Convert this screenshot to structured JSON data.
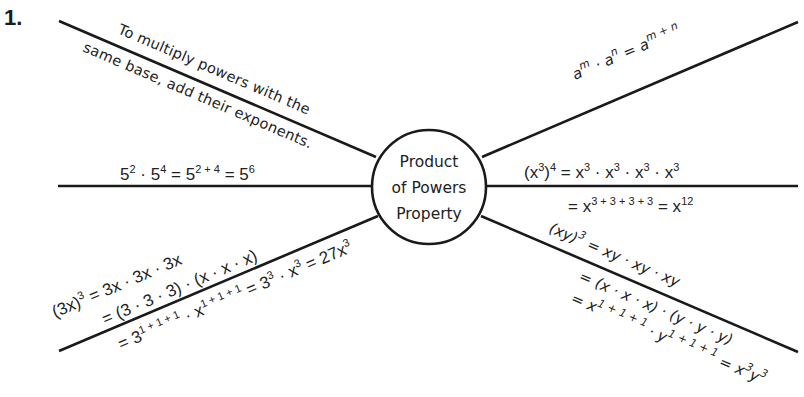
{
  "problem_number": "1.",
  "center": {
    "lines": [
      "Product",
      "of Powers",
      "Property"
    ]
  },
  "branches": {
    "definition": {
      "line1": "To multiply powers with the",
      "line2": "same base, add their exponents."
    },
    "rule": {
      "base1": "a",
      "exp1": "m",
      "dot": " · ",
      "base2": "a",
      "exp2": "n",
      "eq": " = ",
      "base3": "a",
      "exp3": "m + n"
    },
    "example_numeric": {
      "parts": [
        "5",
        "2",
        " · ",
        "5",
        "4",
        " = ",
        "5",
        "2 + 4",
        " = ",
        "5",
        "6"
      ]
    },
    "power_of_power": {
      "line1": {
        "lhs_base": "(x",
        "lhs_inner_exp": "3",
        "lhs_close": ")",
        "lhs_outer_exp": "4",
        "rhs": [
          " = x",
          "3",
          " · x",
          "3",
          " · x",
          "3",
          " · x",
          "3"
        ]
      },
      "line2": {
        "parts": [
          "= x",
          "3 + 3 + 3 + 3",
          " = x",
          "12"
        ]
      }
    },
    "power_of_product_3x": {
      "line1": {
        "parts": [
          "(3x)",
          "3",
          " = 3x · 3x · 3x"
        ]
      },
      "line2": {
        "text": "= (3 · 3 · 3) · (x · x · x)"
      },
      "line3": {
        "parts": [
          "= 3",
          "1 + 1 + 1",
          " · x",
          "1 + 1 + 1",
          " = 3",
          "3",
          " · x",
          "3",
          " = 27x",
          "3"
        ]
      }
    },
    "power_of_product_xy": {
      "line1": {
        "parts": [
          "(xy)",
          "3",
          " = xy · xy · xy"
        ]
      },
      "line2": {
        "text": "= (x · x · x) · (y · y · y)"
      },
      "line3": {
        "parts": [
          "= x",
          "1 + 1 + 1",
          " · y",
          "1 + 1 + 1",
          " = x",
          "3",
          "y",
          "3"
        ]
      }
    }
  },
  "colors": {
    "ink": "#1a1a1a",
    "background": "#ffffff"
  }
}
